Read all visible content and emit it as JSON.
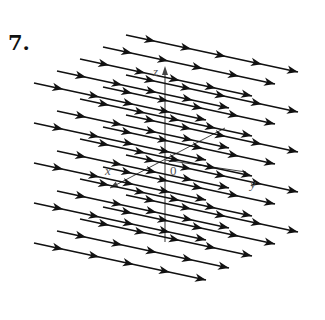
{
  "figure": {
    "problem_number": "7.",
    "labels": {
      "x_axis": "x",
      "y_axis": "y",
      "z_axis": "z",
      "origin": "0"
    },
    "colors": {
      "arrow": "#111111",
      "axis": "#444444",
      "background": "#ffffff"
    },
    "lattice": {
      "origin_start": [
        34,
        243
      ],
      "x_layer_step": [
        23,
        -12
      ],
      "z_row_step": [
        0,
        -40
      ],
      "x_layers": 5,
      "z_rows": 5,
      "line_vector": [
        172,
        37
      ],
      "arrowhead_fractions": [
        0.17,
        0.38,
        0.58,
        0.79,
        1.0
      ]
    },
    "axes": {
      "origin_px": [
        165,
        160
      ],
      "z_axis": {
        "from": [
          165,
          242
        ],
        "to": [
          165,
          66
        ]
      },
      "x_axis": {
        "from": [
          225,
          128
        ],
        "to": [
          110,
          188
        ]
      },
      "y_axis_label_px": [
        250,
        176
      ],
      "x_axis_label_px": [
        105,
        163
      ],
      "z_axis_label_px": [
        153,
        64
      ],
      "origin_label_px": [
        170,
        163
      ]
    }
  }
}
